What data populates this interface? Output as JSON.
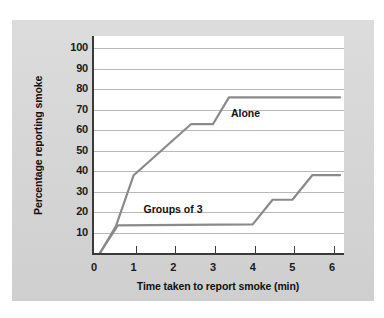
{
  "figure": {
    "background_color": "#d8d8d8",
    "plot_background": "#ffffff",
    "line_color": "#8a8a8a",
    "axis_color": "#3a3a3a",
    "grid_color": "#b9b9b9"
  },
  "chart_data": {
    "type": "line",
    "title": "",
    "xlabel": "Time taken to report smoke (min)",
    "ylabel": "Percentage reporting smoke",
    "xlim": [
      0,
      6.3
    ],
    "ylim": [
      0,
      106
    ],
    "xticks": [
      "0",
      "1",
      "2",
      "3",
      "4",
      "5",
      "6"
    ],
    "xtick_values": [
      0,
      1,
      2,
      3,
      4,
      5,
      6
    ],
    "yticks": [
      "10",
      "20",
      "30",
      "40",
      "50",
      "60",
      "70",
      "80",
      "90",
      "100"
    ],
    "ytick_values": [
      10,
      20,
      30,
      40,
      50,
      60,
      70,
      80,
      90,
      100
    ],
    "grid": "horizontal",
    "legend_position": "inline-annotations",
    "series": [
      {
        "name": "Alone",
        "label_x": 3.45,
        "label_y": 68,
        "points": [
          [
            0.15,
            0
          ],
          [
            0.55,
            13
          ],
          [
            1.0,
            38
          ],
          [
            2.45,
            63
          ],
          [
            3.0,
            63
          ],
          [
            3.4,
            76
          ],
          [
            6.2,
            76
          ]
        ]
      },
      {
        "name": "Groups of 3",
        "label_x": 1.25,
        "label_y": 21,
        "points": [
          [
            0.15,
            0
          ],
          [
            0.6,
            13.5
          ],
          [
            4.0,
            14
          ],
          [
            4.5,
            26
          ],
          [
            5.0,
            26
          ],
          [
            5.5,
            38
          ],
          [
            6.2,
            38
          ]
        ]
      }
    ]
  }
}
